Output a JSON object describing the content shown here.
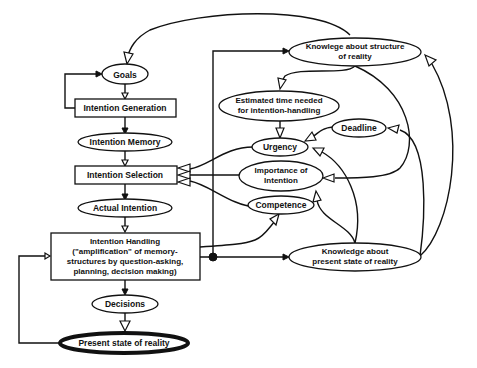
{
  "diagram": {
    "nodes": {
      "goals": {
        "label": "Goals",
        "shape": "ellipse"
      },
      "intention_generation": {
        "label": "Intention Generation",
        "shape": "rect"
      },
      "intention_memory": {
        "label": "Intention Memory",
        "shape": "ellipse"
      },
      "intention_selection": {
        "label": "Intention Selection",
        "shape": "rect"
      },
      "actual_intention": {
        "label": "Actual Intention",
        "shape": "ellipse"
      },
      "intention_handling": {
        "label_lines": [
          "Intention Handling",
          "(\"amplification\" of memory-",
          "structures by question-asking,",
          "planning, decision making)"
        ],
        "shape": "rect"
      },
      "decisions": {
        "label": "Decisions",
        "shape": "ellipse"
      },
      "present_state": {
        "label": "Present state of reality",
        "shape": "ellipse-bold"
      },
      "knowledge_structure": {
        "label_lines": [
          "Knowlege about structure",
          "of reality"
        ],
        "shape": "ellipse"
      },
      "estimated_time": {
        "label_lines": [
          "Estimated time needed",
          "for intention-handling"
        ],
        "shape": "ellipse"
      },
      "deadline": {
        "label": "Deadline",
        "shape": "ellipse"
      },
      "urgency": {
        "label": "Urgency",
        "shape": "ellipse"
      },
      "importance": {
        "label_lines": [
          "Importance of",
          "Intention"
        ],
        "shape": "ellipse"
      },
      "competence": {
        "label": "Competence",
        "shape": "ellipse"
      },
      "knowledge_present": {
        "label_lines": [
          "Knowledge about",
          "present state of reality"
        ],
        "shape": "ellipse"
      }
    },
    "edges": [
      {
        "from": "goals",
        "to": "intention_generation"
      },
      {
        "from": "intention_generation",
        "to": "goals"
      },
      {
        "from": "intention_generation",
        "to": "intention_memory"
      },
      {
        "from": "intention_memory",
        "to": "intention_selection"
      },
      {
        "from": "intention_selection",
        "to": "actual_intention"
      },
      {
        "from": "actual_intention",
        "to": "intention_handling"
      },
      {
        "from": "intention_handling",
        "to": "decisions"
      },
      {
        "from": "decisions",
        "to": "present_state"
      },
      {
        "from": "present_state",
        "to": "intention_handling"
      },
      {
        "from": "intention_handling",
        "to": "knowledge_structure"
      },
      {
        "from": "intention_handling",
        "to": "knowledge_present"
      },
      {
        "from": "intention_handling",
        "to": "competence"
      },
      {
        "from": "knowledge_structure",
        "to": "goals"
      },
      {
        "from": "knowledge_structure",
        "to": "estimated_time"
      },
      {
        "from": "knowledge_structure",
        "to": "importance"
      },
      {
        "from": "estimated_time",
        "to": "urgency"
      },
      {
        "from": "deadline",
        "to": "urgency"
      },
      {
        "from": "urgency",
        "to": "intention_selection"
      },
      {
        "from": "importance",
        "to": "intention_selection"
      },
      {
        "from": "competence",
        "to": "intention_selection"
      },
      {
        "from": "knowledge_present",
        "to": "urgency"
      },
      {
        "from": "knowledge_present",
        "to": "importance"
      },
      {
        "from": "knowledge_present",
        "to": "deadline"
      },
      {
        "from": "knowledge_present",
        "to": "knowledge_structure"
      }
    ]
  }
}
